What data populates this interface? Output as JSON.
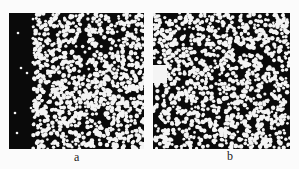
{
  "figure": {
    "panels": [
      {
        "label": "a",
        "description": "binary particle image, black left band with sparse dots, dense white dots on right",
        "background": "#0a0a0a",
        "dot_color": "#f4f4f4",
        "dark_band_width": 24,
        "dense_fraction": 0.52,
        "sparse_dots": [
          [
            9,
            20
          ],
          [
            12,
            55
          ],
          [
            8,
            120
          ],
          [
            18,
            60
          ],
          [
            22,
            95
          ],
          [
            6,
            100
          ],
          [
            25,
            40
          ]
        ],
        "seed": 11
      },
      {
        "label": "b",
        "description": "binary particle image, dense white dots throughout with white blob at left middle",
        "background": "#0a0a0a",
        "dot_color": "#f4f4f4",
        "dense_fraction": 0.48,
        "blob": {
          "x": 0,
          "y": 52,
          "w": 14,
          "h": 18
        },
        "seed": 29
      }
    ]
  }
}
